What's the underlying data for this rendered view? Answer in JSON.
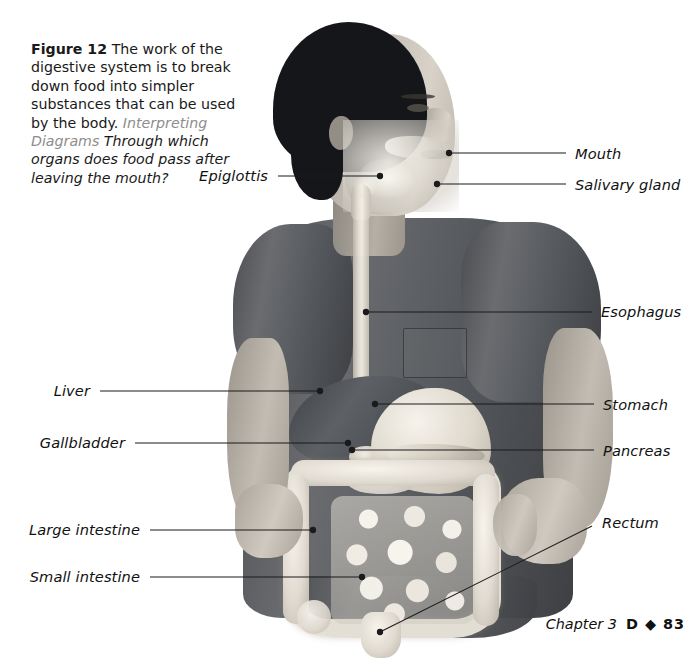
{
  "figure": {
    "number_label": "Figure 12",
    "caption_body": " The work of the digestive system is to break down food into simpler substances that can be used by the body.",
    "skill_label": "Interpreting Diagrams",
    "question": " Through which organs does food pass after leaving the mouth?"
  },
  "labels": {
    "mouth": "Mouth",
    "salivary_gland": "Salivary gland",
    "epiglottis": "Epiglottis",
    "esophagus": "Esophagus",
    "liver": "Liver",
    "gallbladder": "Gallbladder",
    "stomach": "Stomach",
    "pancreas": "Pancreas",
    "large_intestine": "Large intestine",
    "small_intestine": "Small intestine",
    "rectum": "Rectum"
  },
  "footer": {
    "chapter": "Chapter 3",
    "page": "D ◆ 83"
  },
  "colors": {
    "text": "#111111",
    "skill_label": "#8d8d8d",
    "leader_line": "#1b1b1b",
    "shirt": "#55585c",
    "hair": "#15161a"
  }
}
